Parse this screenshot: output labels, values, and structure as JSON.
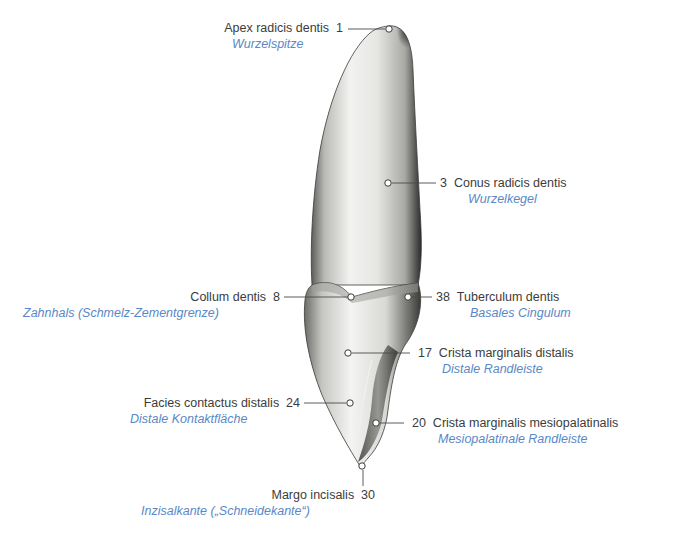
{
  "figure": {
    "colors": {
      "latin_text": "#3c3c3c",
      "german_text": "#5a88c6",
      "leader_line": "#4a4a4a",
      "background": "#ffffff"
    }
  },
  "labels": [
    {
      "id": "apex",
      "number": "1",
      "latin": "Apex radicis dentis",
      "german": "Wurzelspitze",
      "side": "left"
    },
    {
      "id": "conus",
      "number": "3",
      "latin": "Conus radicis dentis",
      "german": "Wurzelkegel",
      "side": "right"
    },
    {
      "id": "collum",
      "number": "8",
      "latin": "Collum dentis",
      "german": "Zahnhals (Schmelz-Zementgrenze)",
      "side": "left"
    },
    {
      "id": "tuberculum",
      "number": "38",
      "latin": "Tuberculum dentis",
      "german": "Basales Cingulum",
      "side": "right"
    },
    {
      "id": "crista-distalis",
      "number": "17",
      "latin": "Crista marginalis distalis",
      "german": "Distale Randleiste",
      "side": "right"
    },
    {
      "id": "facies",
      "number": "24",
      "latin": "Facies contactus distalis",
      "german": "Distale Kontaktfläche",
      "side": "left"
    },
    {
      "id": "crista-mesiopalatinalis",
      "number": "20",
      "latin": "Crista marginalis mesiopalatinalis",
      "german": "Mesiopalatinale Randleiste",
      "side": "right"
    },
    {
      "id": "margo",
      "number": "30",
      "latin": "Margo incisalis",
      "german": "Inzisalkante („Schneidekante“)",
      "side": "bottom"
    }
  ]
}
